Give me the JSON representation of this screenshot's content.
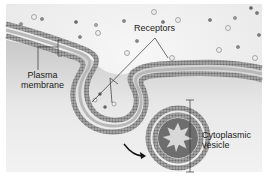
{
  "figure": {
    "labels": {
      "receptors": "Receptors",
      "plasma_membrane_line1": "Plasma",
      "plasma_membrane_line2": "membrane",
      "cytoplasmic_vesicle_line1": "Cytoplasmic",
      "cytoplasmic_vesicle_line2": "vesicle"
    },
    "colors": {
      "background": "#f4f4f4",
      "membrane": "#9a9a9a",
      "membrane_heads": "#7a7a7a",
      "cytoplasm": "#e2e2e2",
      "leader_lines": "#333333",
      "arrow": "#111111"
    }
  }
}
